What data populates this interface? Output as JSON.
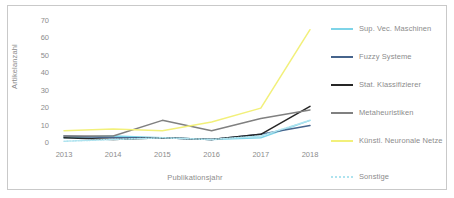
{
  "chart_data": {
    "type": "line",
    "title": "",
    "xlabel": "Publikationsjahr",
    "ylabel": "Artikelanzahl",
    "categories": [
      "2013",
      "2014",
      "2015",
      "2016",
      "2017",
      "2018"
    ],
    "x": [
      2013,
      2014,
      2015,
      2016,
      2017,
      2018
    ],
    "ylim": [
      0,
      70
    ],
    "xlim": [
      2013,
      2018
    ],
    "yticks": [
      "0",
      "10",
      "20",
      "30",
      "40",
      "50",
      "60",
      "70"
    ],
    "ytick_values": [
      0,
      10,
      20,
      30,
      40,
      50,
      60,
      70
    ],
    "grid": false,
    "legend_position": "right",
    "series": [
      {
        "name": "Sup. Vec. Maschinen",
        "color": "#7ed4e8",
        "style": "solid",
        "values": [
          3,
          4,
          3,
          2,
          3,
          13
        ]
      },
      {
        "name": "Fuzzy Systeme",
        "color": "#46648c",
        "style": "solid",
        "values": [
          4,
          3,
          3,
          2,
          5,
          10
        ]
      },
      {
        "name": "Stat. Klassifizierer",
        "color": "#262626",
        "style": "solid",
        "values": [
          3,
          2,
          3,
          2,
          5,
          21
        ]
      },
      {
        "name": "Metaheuristiken",
        "color": "#808080",
        "style": "solid",
        "values": [
          4,
          4,
          13,
          7,
          14,
          19
        ]
      },
      {
        "name": "Künstl. Neuronale Netze",
        "color": "#f2f07a",
        "style": "solid",
        "values": [
          7,
          8,
          7,
          12,
          20,
          65
        ]
      },
      {
        "name": "Sonstige",
        "color": "#aee3ef",
        "style": "dotted",
        "values": [
          1,
          2,
          3,
          2,
          4,
          13
        ]
      }
    ]
  },
  "legend": {
    "items": [
      {
        "label": "Sup. Vec. Maschinen"
      },
      {
        "label": "Fuzzy Systeme"
      },
      {
        "label": "Stat. Klassifizierer"
      },
      {
        "label": "Metaheuristiken"
      },
      {
        "label": "Künstl. Neuronale Netze"
      },
      {
        "label": "Sonstige"
      }
    ]
  }
}
